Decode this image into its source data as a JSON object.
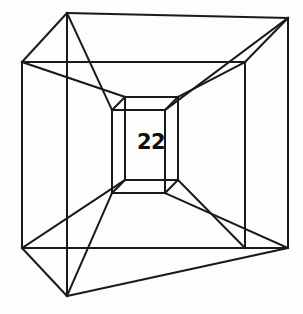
{
  "figure": {
    "type": "tesseract-wireframe",
    "title": "",
    "background_color": "#fdfdfd",
    "stroke_color": "#1a1a1a",
    "label": {
      "text": "22",
      "x": 151,
      "y": 143,
      "color": "#0d0d0d",
      "bold": true
    },
    "geometry": {
      "outer_cube": {
        "front_face": [
          {
            "x": 22,
            "y": 62
          },
          {
            "x": 245,
            "y": 62
          },
          {
            "x": 245,
            "y": 248
          },
          {
            "x": 22,
            "y": 248
          }
        ],
        "back_face": [
          {
            "x": 67,
            "y": 13
          },
          {
            "x": 288,
            "y": 18
          },
          {
            "x": 288,
            "y": 248
          },
          {
            "x": 67,
            "y": 296
          }
        ]
      },
      "inner_cube": {
        "front_face": [
          {
            "x": 125,
            "y": 97
          },
          {
            "x": 178,
            "y": 97
          },
          {
            "x": 178,
            "y": 180
          },
          {
            "x": 125,
            "y": 180
          }
        ],
        "back_face": [
          {
            "x": 112,
            "y": 110
          },
          {
            "x": 165,
            "y": 110
          },
          {
            "x": 165,
            "y": 193
          },
          {
            "x": 112,
            "y": 193
          }
        ]
      }
    }
  },
  "icons": {
    "vertex": "vertex-node",
    "edge": "edge-line"
  }
}
